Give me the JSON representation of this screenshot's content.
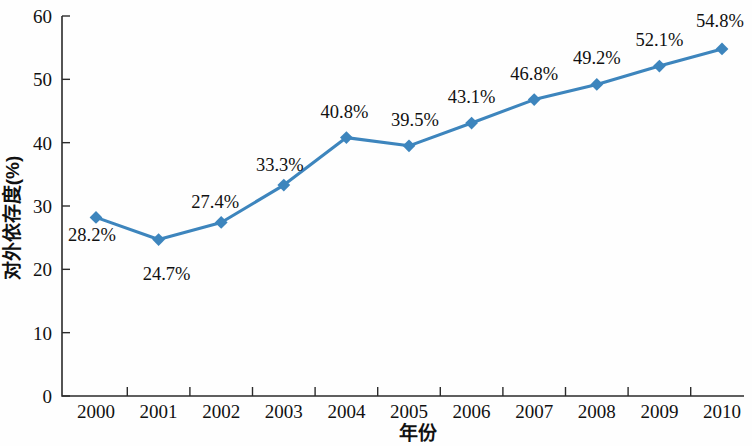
{
  "chart_data": {
    "type": "line",
    "title": "",
    "xlabel": "年份",
    "ylabel": "对外依存度(%)",
    "categories": [
      "2000",
      "2001",
      "2002",
      "2003",
      "2004",
      "2005",
      "2006",
      "2007",
      "2008",
      "2009",
      "2010"
    ],
    "values": [
      28.2,
      24.7,
      27.4,
      33.3,
      40.8,
      39.5,
      43.1,
      46.8,
      49.2,
      52.1,
      54.8
    ],
    "point_labels": [
      "28.2%",
      "24.7%",
      "27.4%",
      "33.3%",
      "40.8%",
      "39.5%",
      "43.1%",
      "46.8%",
      "49.2%",
      "52.1%",
      "54.8%"
    ],
    "ylim": [
      0,
      60
    ],
    "yticks": [
      0,
      10,
      20,
      30,
      40,
      50,
      60
    ],
    "ytick_labels": [
      "0",
      "10",
      "20",
      "30",
      "40",
      "50",
      "60"
    ],
    "grid": false,
    "legend": false,
    "series_color": "#3d85bd",
    "marker": "diamond",
    "axis_color": "#2b2b2b",
    "background": "#fefefe",
    "label_offsets": [
      {
        "dx": -4,
        "dy": 24
      },
      {
        "dx": 8,
        "dy": 40
      },
      {
        "dx": -6,
        "dy": -14
      },
      {
        "dx": -4,
        "dy": -14
      },
      {
        "dx": -2,
        "dy": -20
      },
      {
        "dx": 6,
        "dy": -20
      },
      {
        "dx": 0,
        "dy": -20
      },
      {
        "dx": 0,
        "dy": -20
      },
      {
        "dx": 0,
        "dy": -20
      },
      {
        "dx": 0,
        "dy": -20
      },
      {
        "dx": -2,
        "dy": -22
      }
    ]
  }
}
